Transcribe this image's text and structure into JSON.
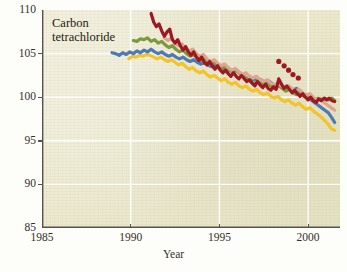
{
  "figure": {
    "annotation": "Carbon tetrachloride",
    "background_color": "#eae7cb",
    "grid_color": "#ffffff",
    "axis_color": "#57524a"
  },
  "chart_data": {
    "type": "line",
    "title": "",
    "subtitle": "",
    "annotations": [
      "Carbon tetrachloride"
    ],
    "xlabel": "Year",
    "ylabel": "",
    "xlim": [
      1985,
      2001.8
    ],
    "ylim": [
      85,
      110
    ],
    "xticks": [
      1985,
      1990,
      1995,
      2000
    ],
    "xtick_labels": [
      "1985",
      "1990",
      "1995",
      "2000"
    ],
    "yticks": [
      85,
      90,
      95,
      100,
      105,
      110
    ],
    "ytick_labels": [
      "85",
      "90",
      "95",
      "100",
      "105",
      "110"
    ],
    "grid": true,
    "grid_axis": "both",
    "legend": "none",
    "series": [
      {
        "name": "station-darkred",
        "color": "#9d1822",
        "style": "thick-line",
        "x": [
          1991.15,
          1991.3,
          1991.45,
          1991.6,
          1991.75,
          1991.9,
          1992.05,
          1992.2,
          1992.35,
          1992.5,
          1992.65,
          1992.8,
          1992.95,
          1993.1,
          1993.25,
          1993.4,
          1993.55,
          1993.7,
          1993.85,
          1994.0,
          1994.15,
          1994.3,
          1994.45,
          1994.6,
          1994.75,
          1994.9,
          1995.05,
          1995.2,
          1995.35,
          1995.5,
          1995.65,
          1995.8,
          1995.95,
          1996.1,
          1996.25,
          1996.4,
          1996.55,
          1996.7,
          1996.85,
          1997.0,
          1997.15,
          1997.3,
          1997.45,
          1997.6,
          1997.75,
          1997.9,
          1998.05,
          1998.2,
          1998.35,
          1998.5,
          1998.65,
          1998.8,
          1998.95,
          1999.1,
          1999.25,
          1999.4,
          1999.55,
          1999.7,
          1999.85,
          2000.0,
          2000.15,
          2000.3,
          2000.45,
          2000.6,
          2000.75,
          2000.9,
          2001.05,
          2001.2,
          2001.35,
          2001.5
        ],
        "y": [
          109.6,
          108.6,
          108.1,
          108.4,
          107.6,
          107.0,
          107.5,
          107.8,
          106.6,
          106.2,
          106.6,
          105.9,
          105.4,
          105.8,
          105.2,
          104.8,
          105.2,
          104.6,
          104.2,
          104.6,
          104.0,
          103.7,
          104.1,
          103.6,
          103.2,
          103.6,
          103.1,
          102.8,
          103.1,
          102.7,
          102.4,
          102.8,
          102.4,
          102.1,
          102.5,
          102.1,
          101.8,
          102.0,
          101.6,
          101.3,
          101.8,
          101.4,
          101.1,
          101.5,
          101.0,
          100.8,
          101.2,
          100.9,
          102.1,
          101.5,
          101.0,
          101.3,
          100.9,
          100.5,
          100.8,
          100.4,
          100.1,
          100.4,
          100.0,
          99.7,
          100.0,
          99.6,
          99.4,
          99.8,
          99.6,
          99.9,
          99.7,
          99.9,
          99.6,
          99.5
        ]
      },
      {
        "name": "station-darkred-dots",
        "color": "#9d1822",
        "style": "scattered-dots",
        "x": [
          1998.35,
          1998.65,
          1998.9,
          1999.15,
          1999.45
        ],
        "y": [
          104.1,
          103.6,
          103.1,
          102.6,
          102.2
        ]
      },
      {
        "name": "station-salmon",
        "color": "#dda58d",
        "style": "thick-line",
        "x": [
          1991.9,
          1992.1,
          1992.3,
          1992.5,
          1992.7,
          1992.9,
          1993.1,
          1993.3,
          1993.5,
          1993.7,
          1993.9,
          1994.1,
          1994.3,
          1994.5,
          1994.7,
          1994.9,
          1995.1,
          1995.3,
          1995.5,
          1995.7,
          1995.9,
          1996.1,
          1996.3,
          1996.5,
          1996.7,
          1996.9,
          1997.1,
          1997.3,
          1997.5,
          1997.7,
          1997.9,
          1998.1,
          1998.3,
          1998.5,
          1998.7,
          1998.9,
          1999.1,
          1999.3,
          1999.5,
          1999.7,
          1999.9,
          2000.1,
          2000.3,
          2000.5,
          2000.7,
          2000.9,
          2001.1,
          2001.3,
          2001.5
        ],
        "y": [
          106.8,
          106.5,
          106.8,
          106.2,
          105.9,
          106.1,
          105.6,
          105.3,
          105.5,
          105.0,
          104.7,
          104.9,
          104.4,
          104.1,
          104.3,
          103.9,
          103.6,
          103.8,
          103.4,
          103.1,
          103.3,
          102.9,
          102.6,
          102.8,
          102.4,
          102.2,
          102.4,
          102.0,
          101.8,
          102.0,
          101.6,
          101.4,
          101.6,
          101.3,
          101.1,
          101.3,
          101.0,
          100.7,
          100.9,
          100.5,
          100.2,
          100.4,
          100.0,
          99.7,
          99.9,
          99.4,
          99.1,
          98.8,
          98.5
        ]
      },
      {
        "name": "station-green",
        "color": "#7a9a3c",
        "style": "thick-line",
        "x": [
          1990.15,
          1990.35,
          1990.55,
          1990.75,
          1990.95,
          1991.15,
          1991.35,
          1991.55,
          1991.75,
          1991.95,
          1992.15,
          1992.35,
          1992.55,
          1992.75,
          1992.95,
          1993.15,
          1993.35,
          1993.55,
          1993.75,
          1993.95,
          1994.15,
          1994.35,
          1994.55,
          1994.75,
          1994.95,
          1995.15,
          1995.35,
          1995.55,
          1995.75,
          1995.95,
          1996.15,
          1996.35,
          1996.55,
          1996.75,
          1996.95,
          1997.15,
          1997.35,
          1997.55,
          1997.75,
          1997.95,
          1998.15,
          1998.35,
          1998.55,
          1998.75,
          1998.95,
          1999.15,
          1999.35,
          1999.55,
          1999.75,
          1999.95,
          2000.15,
          2000.35,
          2000.55,
          2000.75,
          2000.95,
          2001.15,
          2001.35,
          2001.5
        ],
        "y": [
          106.5,
          106.4,
          106.7,
          106.6,
          106.8,
          106.4,
          106.6,
          106.2,
          106.4,
          106.0,
          105.7,
          105.9,
          105.5,
          105.2,
          105.4,
          105.0,
          104.7,
          104.9,
          104.5,
          104.2,
          104.4,
          104.0,
          103.8,
          104.0,
          103.6,
          103.3,
          103.5,
          103.1,
          102.9,
          103.1,
          102.7,
          102.4,
          102.1,
          101.8,
          101.5,
          101.9,
          101.6,
          101.3,
          101.6,
          101.2,
          101.0,
          101.3,
          101.0,
          100.7,
          100.9,
          100.5,
          100.3,
          100.5,
          100.1,
          100.3,
          99.9,
          99.7,
          99.9,
          99.6,
          99.9,
          99.7,
          99.9,
          99.6
        ]
      },
      {
        "name": "station-blue",
        "color": "#4d7ab3",
        "style": "thick-line",
        "x": [
          1988.95,
          1989.15,
          1989.35,
          1989.55,
          1989.75,
          1989.95,
          1990.15,
          1990.35,
          1990.55,
          1990.75,
          1990.95,
          1991.15,
          1991.35,
          1991.55,
          1991.75,
          1991.95,
          1992.15,
          1992.35,
          1992.55,
          1992.75,
          1992.95,
          1993.15,
          1993.35,
          1993.55,
          1993.75,
          1993.95,
          1994.15,
          1994.35,
          1994.55,
          1994.75,
          1994.95,
          1995.15,
          1995.35,
          1995.55,
          1995.75,
          1995.95,
          1996.15,
          1996.35,
          1996.55,
          1996.75,
          1996.95,
          1997.15,
          1997.35,
          1997.55,
          1997.75,
          1997.95,
          1998.15,
          1998.35,
          1998.55,
          1998.75,
          1998.95,
          1999.15,
          1999.35,
          1999.55,
          1999.75,
          1999.95,
          2000.15,
          2000.35,
          2000.55,
          2000.75,
          2000.95,
          2001.15,
          2001.35,
          2001.5
        ],
        "y": [
          105.1,
          105.0,
          104.8,
          105.1,
          104.9,
          105.2,
          105.0,
          105.3,
          105.1,
          105.4,
          105.2,
          105.5,
          105.2,
          105.0,
          105.2,
          104.9,
          104.7,
          104.9,
          104.6,
          104.4,
          104.6,
          104.3,
          104.1,
          104.3,
          104.0,
          103.8,
          104.0,
          103.7,
          103.5,
          103.7,
          103.4,
          103.2,
          103.4,
          103.1,
          102.9,
          103.1,
          102.8,
          102.4,
          102.1,
          101.8,
          102.1,
          101.8,
          102.0,
          101.7,
          101.9,
          101.6,
          101.3,
          101.5,
          101.2,
          100.9,
          101.1,
          100.8,
          101.0,
          100.6,
          100.3,
          100.0,
          99.7,
          99.4,
          99.1,
          98.8,
          98.5,
          98.2,
          97.6,
          97.1
        ]
      },
      {
        "name": "station-yellow",
        "color": "#f0c42a",
        "style": "thick-line",
        "x": [
          1989.9,
          1990.1,
          1990.3,
          1990.5,
          1990.7,
          1990.9,
          1991.1,
          1991.3,
          1991.5,
          1991.7,
          1991.9,
          1992.1,
          1992.3,
          1992.5,
          1992.7,
          1992.9,
          1993.1,
          1993.3,
          1993.5,
          1993.7,
          1993.9,
          1994.1,
          1994.3,
          1994.5,
          1994.7,
          1994.9,
          1995.1,
          1995.3,
          1995.5,
          1995.7,
          1995.9,
          1996.1,
          1996.3,
          1996.5,
          1996.7,
          1996.9,
          1997.1,
          1997.3,
          1997.5,
          1997.7,
          1997.9,
          1998.1,
          1998.3,
          1998.5,
          1998.7,
          1998.9,
          1999.1,
          1999.3,
          1999.5,
          1999.7,
          1999.9,
          2000.1,
          2000.3,
          2000.5,
          2000.7,
          2000.9,
          2001.1,
          2001.3,
          2001.5
        ],
        "y": [
          104.4,
          104.7,
          104.6,
          104.8,
          104.7,
          104.9,
          104.8,
          104.6,
          104.4,
          104.6,
          104.3,
          104.1,
          104.3,
          104.0,
          103.7,
          103.9,
          103.5,
          103.2,
          103.4,
          103.0,
          102.8,
          103.0,
          102.6,
          102.3,
          102.5,
          102.2,
          101.9,
          102.1,
          101.7,
          101.5,
          101.7,
          101.3,
          101.1,
          101.3,
          100.9,
          100.7,
          100.9,
          100.5,
          100.3,
          100.5,
          100.1,
          99.9,
          100.1,
          99.7,
          99.5,
          99.7,
          99.3,
          99.1,
          99.3,
          98.9,
          98.6,
          98.8,
          98.4,
          98.1,
          97.8,
          97.4,
          97.0,
          96.4,
          96.2
        ]
      }
    ]
  }
}
